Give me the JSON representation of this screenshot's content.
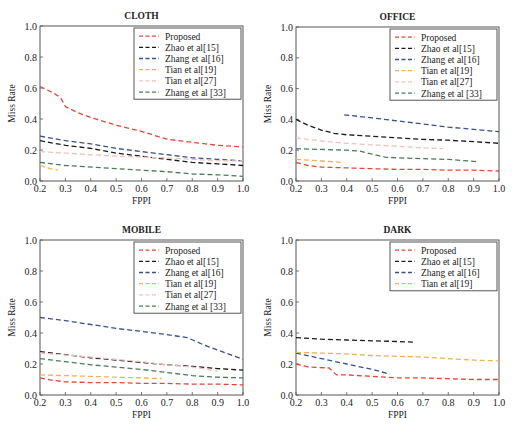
{
  "figure": {
    "colors": {
      "Proposed": "#e0483a",
      "Zhao et al[15]": "#1a1a1a",
      "Zhang et al[16]": "#3a4f8c",
      "Tian et al[19]": "#f2b34a",
      "Tian et al[27]": "#f2c2c2",
      "Zhang et al [33]": "#4a7a5a"
    }
  },
  "chart_data": [
    {
      "type": "line",
      "title": "CLOTH",
      "xlabel": "FPPI",
      "ylabel": "Miss Rate",
      "xlim": [
        0.2,
        1.0
      ],
      "ylim": [
        0.0,
        1.0
      ],
      "xticks": [
        "0.2",
        "0.3",
        "0.4",
        "0.5",
        "0.6",
        "0.7",
        "0.8",
        "0.9",
        "1.0"
      ],
      "yticks": [
        "0.0",
        "0.2",
        "0.4",
        "0.6",
        "0.8",
        "1.0"
      ],
      "grid": false,
      "legend_position": "upper right",
      "legend": [
        "Proposed",
        "Zhao et al[15]",
        "Zhang et al[16]",
        "Tian et al[19]",
        "Tian et al[27]",
        "Zhang et al [33]"
      ],
      "series": [
        {
          "name": "Proposed",
          "points": [
            [
              0.2,
              0.61
            ],
            [
              0.25,
              0.57
            ],
            [
              0.28,
              0.54
            ],
            [
              0.3,
              0.48
            ],
            [
              0.35,
              0.44
            ],
            [
              0.4,
              0.41
            ],
            [
              0.5,
              0.36
            ],
            [
              0.6,
              0.32
            ],
            [
              0.7,
              0.27
            ],
            [
              0.8,
              0.25
            ],
            [
              0.9,
              0.23
            ],
            [
              1.0,
              0.22
            ]
          ]
        },
        {
          "name": "Zhao et al[15]",
          "points": [
            [
              0.2,
              0.26
            ],
            [
              0.3,
              0.23
            ],
            [
              0.4,
              0.21
            ],
            [
              0.5,
              0.18
            ],
            [
              0.6,
              0.16
            ],
            [
              0.7,
              0.14
            ],
            [
              0.8,
              0.12
            ],
            [
              0.9,
              0.11
            ],
            [
              1.0,
              0.1
            ]
          ]
        },
        {
          "name": "Zhang et al[16]",
          "points": [
            [
              0.2,
              0.29
            ],
            [
              0.3,
              0.26
            ],
            [
              0.4,
              0.24
            ],
            [
              0.5,
              0.21
            ],
            [
              0.6,
              0.19
            ],
            [
              0.7,
              0.17
            ],
            [
              0.8,
              0.15
            ],
            [
              0.9,
              0.14
            ],
            [
              1.0,
              0.13
            ]
          ]
        },
        {
          "name": "Tian et al[19]",
          "points": [
            [
              0.2,
              0.1
            ],
            [
              0.24,
              0.08
            ],
            [
              0.27,
              0.07
            ]
          ]
        },
        {
          "name": "Tian et al[27]",
          "points": [
            [
              0.2,
              0.19
            ],
            [
              0.3,
              0.18
            ],
            [
              0.5,
              0.16
            ],
            [
              0.7,
              0.15
            ],
            [
              0.8,
              0.14
            ],
            [
              0.9,
              0.13
            ],
            [
              1.0,
              0.13
            ]
          ]
        },
        {
          "name": "Zhang et al [33]",
          "points": [
            [
              0.2,
              0.12
            ],
            [
              0.3,
              0.1
            ],
            [
              0.5,
              0.08
            ],
            [
              0.7,
              0.06
            ],
            [
              0.8,
              0.045
            ],
            [
              0.9,
              0.04
            ],
            [
              1.0,
              0.03
            ]
          ]
        }
      ]
    },
    {
      "type": "line",
      "title": "OFFICE",
      "xlabel": "FPPI",
      "ylabel": "Miss Rate",
      "xlim": [
        0.2,
        1.0
      ],
      "ylim": [
        0.0,
        1.0
      ],
      "xticks": [
        "0.2",
        "0.3",
        "0.4",
        "0.5",
        "0.6",
        "0.7",
        "0.8",
        "0.9",
        "1.0"
      ],
      "yticks": [
        "0.0",
        "0.2",
        "0.4",
        "0.6",
        "0.8",
        "1.0"
      ],
      "grid": false,
      "legend_position": "upper right",
      "legend": [
        "Proposed",
        "Zhao et al[15]",
        "Zhang et al[16]",
        "Tian et al[19]",
        "Tian et al[27]",
        "Zhang et al [33]"
      ],
      "series": [
        {
          "name": "Proposed",
          "points": [
            [
              0.2,
              0.12
            ],
            [
              0.25,
              0.1
            ],
            [
              0.3,
              0.09
            ],
            [
              0.4,
              0.085
            ],
            [
              0.5,
              0.08
            ],
            [
              0.6,
              0.075
            ],
            [
              0.7,
              0.075
            ],
            [
              0.8,
              0.07
            ],
            [
              0.9,
              0.07
            ],
            [
              1.0,
              0.065
            ]
          ]
        },
        {
          "name": "Zhao et al[15]",
          "points": [
            [
              0.2,
              0.4
            ],
            [
              0.25,
              0.36
            ],
            [
              0.3,
              0.33
            ],
            [
              0.35,
              0.31
            ],
            [
              0.4,
              0.3
            ],
            [
              0.5,
              0.29
            ],
            [
              0.6,
              0.28
            ],
            [
              0.7,
              0.27
            ],
            [
              0.8,
              0.265
            ],
            [
              0.9,
              0.255
            ],
            [
              1.0,
              0.245
            ]
          ]
        },
        {
          "name": "Zhang et al[16]",
          "points": [
            [
              0.39,
              0.43
            ],
            [
              0.5,
              0.41
            ],
            [
              0.6,
              0.39
            ],
            [
              0.7,
              0.37
            ],
            [
              0.8,
              0.35
            ],
            [
              0.9,
              0.335
            ],
            [
              1.0,
              0.32
            ]
          ]
        },
        {
          "name": "Tian et al[19]",
          "points": [
            [
              0.2,
              0.14
            ],
            [
              0.3,
              0.13
            ],
            [
              0.39,
              0.12
            ]
          ]
        },
        {
          "name": "Tian et al[27]",
          "points": [
            [
              0.2,
              0.28
            ],
            [
              0.3,
              0.26
            ],
            [
              0.4,
              0.245
            ],
            [
              0.5,
              0.235
            ],
            [
              0.6,
              0.225
            ],
            [
              0.7,
              0.215
            ],
            [
              0.78,
              0.21
            ]
          ]
        },
        {
          "name": "Zhang et al [33]",
          "points": [
            [
              0.2,
              0.21
            ],
            [
              0.3,
              0.205
            ],
            [
              0.4,
              0.2
            ],
            [
              0.45,
              0.195
            ],
            [
              0.5,
              0.175
            ],
            [
              0.55,
              0.155
            ],
            [
              0.6,
              0.15
            ],
            [
              0.7,
              0.145
            ],
            [
              0.8,
              0.14
            ],
            [
              0.92,
              0.125
            ]
          ]
        }
      ]
    },
    {
      "type": "line",
      "title": "MOBILE",
      "xlabel": "FPPI",
      "ylabel": "Miss Rate",
      "xlim": [
        0.2,
        1.0
      ],
      "ylim": [
        0.0,
        1.0
      ],
      "xticks": [
        "0.2",
        "0.3",
        "0.4",
        "0.5",
        "0.6",
        "0.7",
        "0.8",
        "0.9",
        "1.0"
      ],
      "yticks": [
        "0.0",
        "0.2",
        "0.4",
        "0.6",
        "0.8",
        "1.0"
      ],
      "grid": false,
      "legend_position": "upper right",
      "legend": [
        "Proposed",
        "Zhao et al[15]",
        "Zhang et al[16]",
        "Tian et al[19]",
        "Tian et al[27]",
        "Zhang et al [33]"
      ],
      "series": [
        {
          "name": "Proposed",
          "points": [
            [
              0.2,
              0.11
            ],
            [
              0.25,
              0.095
            ],
            [
              0.3,
              0.085
            ],
            [
              0.4,
              0.08
            ],
            [
              0.5,
              0.08
            ],
            [
              0.6,
              0.075
            ],
            [
              0.7,
              0.075
            ],
            [
              0.8,
              0.07
            ],
            [
              0.9,
              0.07
            ],
            [
              1.0,
              0.065
            ]
          ]
        },
        {
          "name": "Zhao et al[15]",
          "points": [
            [
              0.2,
              0.28
            ],
            [
              0.3,
              0.26
            ],
            [
              0.4,
              0.24
            ],
            [
              0.5,
              0.225
            ],
            [
              0.6,
              0.21
            ],
            [
              0.7,
              0.195
            ],
            [
              0.8,
              0.185
            ],
            [
              0.9,
              0.17
            ],
            [
              1.0,
              0.16
            ]
          ]
        },
        {
          "name": "Zhang et al[16]",
          "points": [
            [
              0.2,
              0.5
            ],
            [
              0.3,
              0.48
            ],
            [
              0.4,
              0.455
            ],
            [
              0.5,
              0.43
            ],
            [
              0.6,
              0.41
            ],
            [
              0.7,
              0.39
            ],
            [
              0.78,
              0.37
            ],
            [
              0.85,
              0.32
            ],
            [
              0.9,
              0.29
            ],
            [
              1.0,
              0.23
            ]
          ]
        },
        {
          "name": "Tian et al[19]",
          "points": [
            [
              0.2,
              0.13
            ],
            [
              0.3,
              0.125
            ],
            [
              0.4,
              0.12
            ],
            [
              0.5,
              0.115
            ],
            [
              0.6,
              0.11
            ],
            [
              0.68,
              0.105
            ]
          ]
        },
        {
          "name": "Tian et al[27]",
          "points": [
            [
              0.2,
              0.27
            ],
            [
              0.4,
              0.245
            ],
            [
              0.5,
              0.23
            ],
            [
              0.6,
              0.215
            ],
            [
              0.7,
              0.195
            ],
            [
              0.8,
              0.18
            ],
            [
              0.9,
              0.155
            ]
          ]
        },
        {
          "name": "Zhang et al [33]",
          "points": [
            [
              0.2,
              0.235
            ],
            [
              0.3,
              0.215
            ],
            [
              0.4,
              0.195
            ],
            [
              0.5,
              0.18
            ],
            [
              0.6,
              0.165
            ],
            [
              0.7,
              0.145
            ],
            [
              0.8,
              0.125
            ],
            [
              0.9,
              0.115
            ],
            [
              1.0,
              0.11
            ]
          ]
        }
      ]
    },
    {
      "type": "line",
      "title": "DARK",
      "xlabel": "FPPI",
      "ylabel": "Miss Rate",
      "xlim": [
        0.2,
        1.0
      ],
      "ylim": [
        0.0,
        1.0
      ],
      "xticks": [
        "0.2",
        "0.3",
        "0.4",
        "0.5",
        "0.6",
        "0.7",
        "0.8",
        "0.9",
        "1.0"
      ],
      "yticks": [
        "0.0",
        "0.2",
        "0.4",
        "0.6",
        "0.8",
        "1.0"
      ],
      "grid": false,
      "legend_position": "upper right",
      "legend": [
        "Proposed",
        "Zhao et al[15]",
        "Zhang et al[16]",
        "Tian et al[19]"
      ],
      "series": [
        {
          "name": "Proposed",
          "points": [
            [
              0.2,
              0.2
            ],
            [
              0.25,
              0.18
            ],
            [
              0.33,
              0.175
            ],
            [
              0.36,
              0.13
            ],
            [
              0.4,
              0.13
            ],
            [
              0.5,
              0.12
            ],
            [
              0.6,
              0.11
            ],
            [
              0.7,
              0.11
            ],
            [
              0.8,
              0.105
            ],
            [
              0.9,
              0.1
            ],
            [
              1.0,
              0.1
            ]
          ]
        },
        {
          "name": "Zhao et al[15]",
          "points": [
            [
              0.2,
              0.37
            ],
            [
              0.3,
              0.36
            ],
            [
              0.4,
              0.355
            ],
            [
              0.5,
              0.35
            ],
            [
              0.6,
              0.345
            ],
            [
              0.67,
              0.34
            ]
          ]
        },
        {
          "name": "Zhang et al[16]",
          "points": [
            [
              0.2,
              0.27
            ],
            [
              0.3,
              0.235
            ],
            [
              0.4,
              0.2
            ],
            [
              0.5,
              0.165
            ],
            [
              0.57,
              0.135
            ]
          ]
        },
        {
          "name": "Tian et al[19]",
          "points": [
            [
              0.2,
              0.275
            ],
            [
              0.3,
              0.27
            ],
            [
              0.4,
              0.265
            ],
            [
              0.5,
              0.255
            ],
            [
              0.6,
              0.25
            ],
            [
              0.7,
              0.245
            ],
            [
              0.8,
              0.235
            ],
            [
              0.9,
              0.225
            ],
            [
              1.0,
              0.22
            ]
          ]
        }
      ]
    }
  ]
}
